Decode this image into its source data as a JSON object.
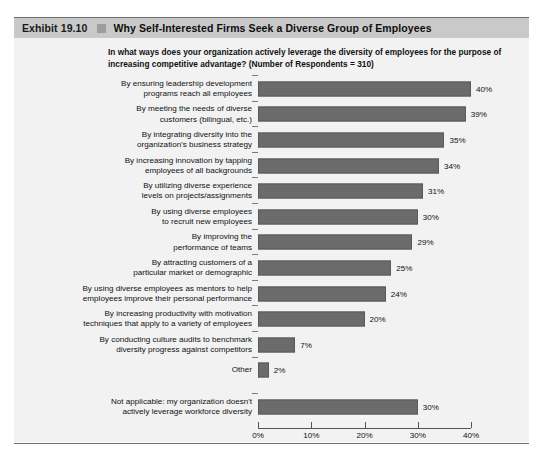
{
  "header": {
    "exhibit_number": "Exhibit 19.10",
    "title": "Why Self-Interested Firms Seek a Diverse Group of Employees",
    "band_color": "#c9c9c9",
    "square_color": "#9d9d9d"
  },
  "subtitle": "In what ways does your organization actively leverage the diversity of employees for the purpose of increasing competitive advantage? (Number of Respondents = 310)",
  "chart_data": {
    "type": "bar",
    "orientation": "horizontal",
    "title": "Why Self-Interested Firms Seek a Diverse Group of Employees",
    "subtitle": "In what ways does your organization actively leverage the diversity of employees for the purpose of increasing competitive advantage? (Number of Respondents = 310)",
    "xlabel": "",
    "ylabel": "",
    "xlim": [
      0,
      40
    ],
    "grid": false,
    "legend": null,
    "bar_color": "#6b6b6b",
    "respondents": 310,
    "xticks": [
      0,
      10,
      20,
      30,
      40
    ],
    "xtick_labels": [
      "0%",
      "10%",
      "20%",
      "30%",
      "40%"
    ],
    "categories": [
      "By ensuring leadership development programs reach all employees",
      "By meeting the needs of diverse customers (bilingual, etc.)",
      "By integrating diversity into the organization's business strategy",
      "By increasing innovation by tapping employees of all backgrounds",
      "By utilizing diverse experience levels on projects/assignments",
      "By using diverse employees to recruit new employees",
      "By improving the performance of teams",
      "By attracting customers of a particular market or demographic",
      "By using diverse employees as mentors to help employees improve their personal performance",
      "By increasing productivity with motivation techniques that apply to a variety of employees",
      "By conducting culture audits to benchmark diversity progress against competitors",
      "Other",
      "Not applicable: my organization doesn't actively leverage workforce diversity"
    ],
    "values": [
      40,
      39,
      35,
      34,
      31,
      30,
      29,
      25,
      24,
      20,
      7,
      2,
      30
    ],
    "value_labels": [
      "40%",
      "39%",
      "35%",
      "34%",
      "31%",
      "30%",
      "29%",
      "25%",
      "24%",
      "20%",
      "7%",
      "2%",
      "30%"
    ]
  },
  "rows": [
    {
      "label_line1": "By ensuring leadership development",
      "label_line2": "programs reach all employees",
      "value": 40,
      "value_label": "40%",
      "gap_before": false
    },
    {
      "label_line1": "By meeting the needs of diverse",
      "label_line2": "customers (bilingual, etc.)",
      "value": 39,
      "value_label": "39%",
      "gap_before": false
    },
    {
      "label_line1": "By integrating diversity into the",
      "label_line2": "organization's business strategy",
      "value": 35,
      "value_label": "35%",
      "gap_before": false
    },
    {
      "label_line1": "By increasing innovation by tapping",
      "label_line2": "employees of all backgrounds",
      "value": 34,
      "value_label": "34%",
      "gap_before": false
    },
    {
      "label_line1": "By utilizing diverse experience",
      "label_line2": "levels on projects/assignments",
      "value": 31,
      "value_label": "31%",
      "gap_before": false
    },
    {
      "label_line1": "By using diverse employees",
      "label_line2": "to recruit new employees",
      "value": 30,
      "value_label": "30%",
      "gap_before": false
    },
    {
      "label_line1": "By improving the",
      "label_line2": "performance of teams",
      "value": 29,
      "value_label": "29%",
      "gap_before": false
    },
    {
      "label_line1": "By attracting customers of a",
      "label_line2": "particular market or demographic",
      "value": 25,
      "value_label": "25%",
      "gap_before": false
    },
    {
      "label_line1": "By using diverse employees as mentors to help",
      "label_line2": "employees improve their personal performance",
      "value": 24,
      "value_label": "24%",
      "gap_before": false
    },
    {
      "label_line1": "By increasing productivity with motivation",
      "label_line2": "techniques that apply to a variety of employees",
      "value": 20,
      "value_label": "20%",
      "gap_before": false
    },
    {
      "label_line1": "By conducting culture audits to benchmark",
      "label_line2": "diversity progress against competitors",
      "value": 7,
      "value_label": "7%",
      "gap_before": false
    },
    {
      "label_line1": "Other",
      "label_line2": "",
      "value": 2,
      "value_label": "2%",
      "gap_before": false
    },
    {
      "label_line1": "Not applicable: my organization doesn't",
      "label_line2": "actively leverage workforce diversity",
      "value": 30,
      "value_label": "30%",
      "gap_before": true
    }
  ],
  "axis": {
    "ticks": [
      {
        "value": 0,
        "label": "0%"
      },
      {
        "value": 10,
        "label": "10%"
      },
      {
        "value": 20,
        "label": "20%"
      },
      {
        "value": 30,
        "label": "30%"
      },
      {
        "value": 40,
        "label": "40%"
      }
    ]
  }
}
